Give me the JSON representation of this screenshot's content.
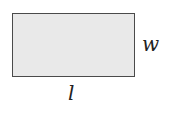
{
  "diagram": {
    "shape": "rectangle",
    "fill_color": "#e9e9e9",
    "stroke_color": "#4a4a4a",
    "labels": {
      "width": "w",
      "length": "l"
    }
  }
}
